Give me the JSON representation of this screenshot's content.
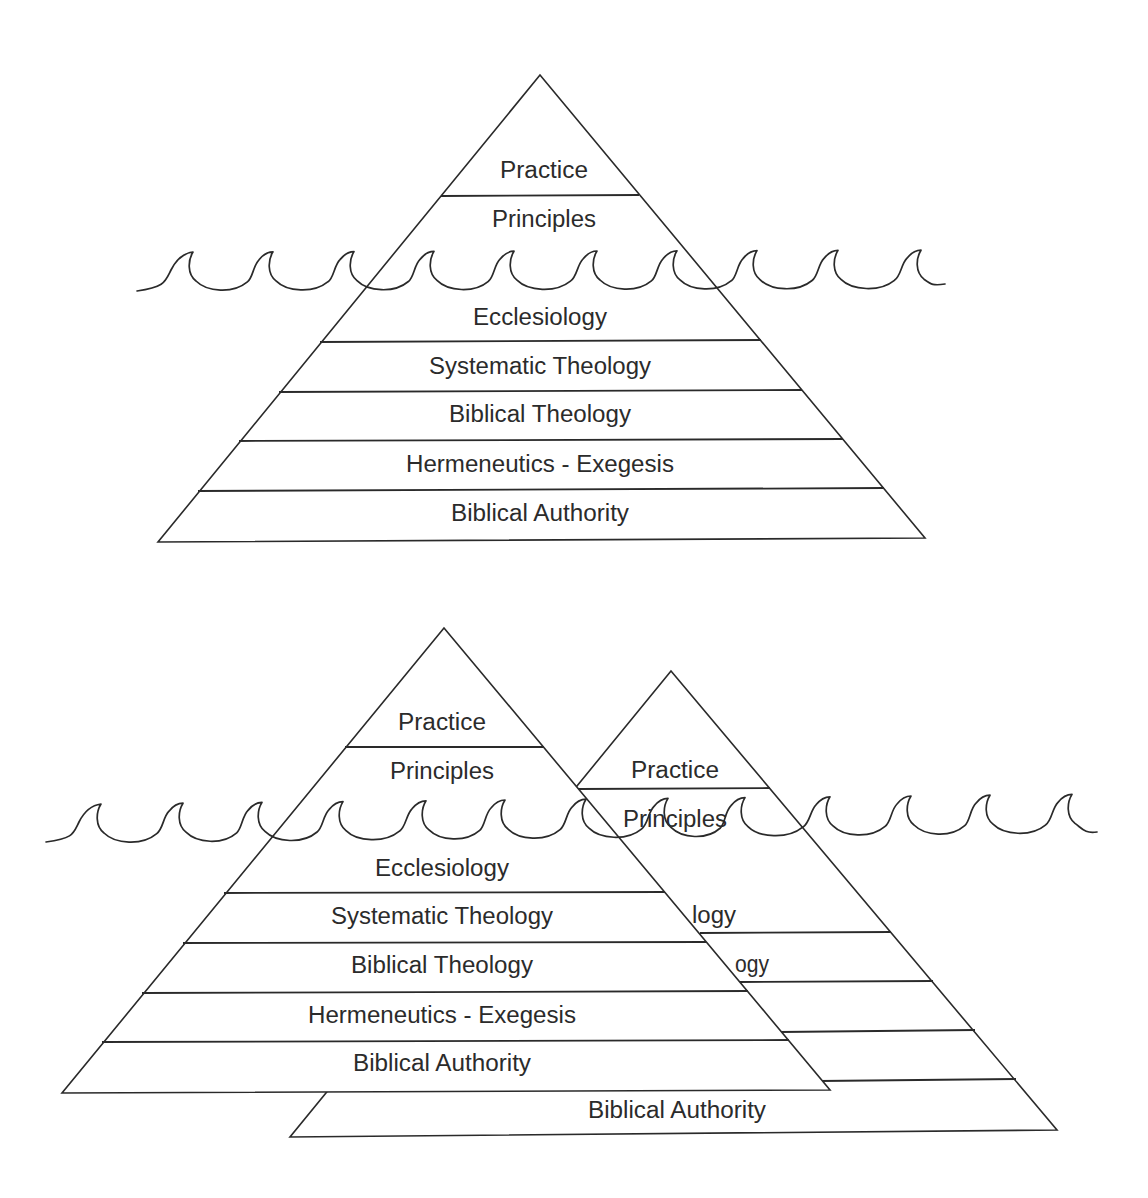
{
  "figure_top": {
    "title": "Iceberg pyramid - single",
    "layers_above_water": [
      "Practice",
      "Principles"
    ],
    "layers_below_water": [
      "Ecclesiology",
      "Systematic Theology",
      "Biblical Theology",
      "Hermeneutics - Exegesis",
      "Biblical Authority"
    ]
  },
  "figure_bottom": {
    "front_pyramid": {
      "labels": [
        "Practice",
        "Principles",
        "Ecclesiology",
        "Systematic Theology",
        "Biblical Theology",
        "Hermeneutics - Exegesis",
        "Biblical Authority"
      ]
    },
    "back_pyramid": {
      "labels": [
        "Practice",
        "Principles",
        "logy",
        "ogy",
        "Biblical Authority"
      ]
    }
  },
  "colors": {
    "line": "#2a2a2a",
    "text": "#2b2b2b",
    "background": "#ffffff"
  }
}
